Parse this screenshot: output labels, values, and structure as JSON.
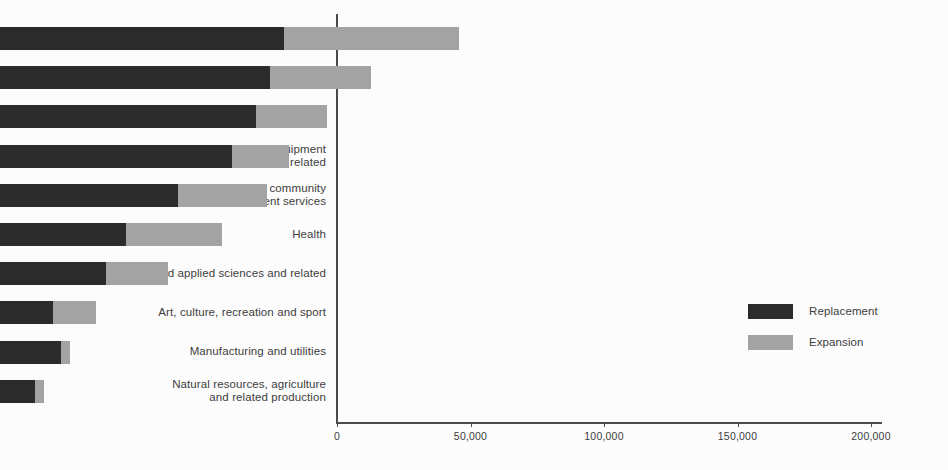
{
  "chart_data": {
    "type": "bar",
    "orientation": "horizontal",
    "stacked": true,
    "title": "",
    "subtitle": "",
    "xlabel": "",
    "ylabel": "",
    "xlim": [
      0,
      204000
    ],
    "grid": false,
    "legend_position": "middle-right",
    "categories": [
      "Sales and Service",
      "Business, finance and administration",
      "Management",
      "Trades, transport and equipment\noperators and related",
      "Education, law and social, community\nand government services",
      "Health",
      "Natural and applied sciences and related",
      "Art, culture, recreation and sport",
      "Manufacturing and utilities",
      "Natural resources, agriculture\nand related production"
    ],
    "series": [
      {
        "name": "Replacement",
        "color": "#2b2b2b",
        "values": [
          106400,
          101100,
          95900,
          86900,
          66700,
          47200,
          39700,
          19900,
          22800,
          13100
        ]
      },
      {
        "name": "Expansion",
        "color": "#a3a3a3",
        "values": [
          65500,
          37800,
          26600,
          21300,
          33300,
          35900,
          23200,
          16100,
          3400,
          3400
        ]
      }
    ],
    "totals": [
      171900,
      138900,
      122500,
      108200,
      100000,
      83100,
      62900,
      36000,
      26200,
      16500
    ],
    "xticks": [
      0,
      50000,
      100000,
      150000,
      200000
    ],
    "xticklabels": [
      "0",
      "50,000",
      "100,000",
      "150,000",
      "200,000"
    ]
  },
  "legend": {
    "items": [
      {
        "label": "Replacement",
        "color": "#2b2b2b"
      },
      {
        "label": "Expansion",
        "color": "#a3a3a3"
      }
    ]
  },
  "colors": {
    "background": "#fcfcfc",
    "axis": "#4a4a4a",
    "text": "#3d3d3d",
    "replacement": "#2b2b2b",
    "expansion": "#a3a3a3"
  }
}
